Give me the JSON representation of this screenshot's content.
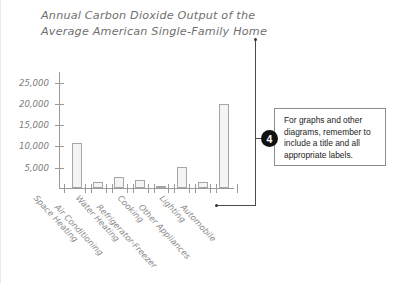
{
  "chart_data": {
    "type": "bar",
    "title": "Annual Carbon Dioxide Output of the\nAverage American Single-Family Home",
    "xlabel": "",
    "ylabel": "",
    "ylim": [
      0,
      27500
    ],
    "grid": false,
    "legend": "none",
    "ytick_labels": [
      "5,000",
      "10,000",
      "15,000",
      "20,000",
      "25,000"
    ],
    "ytick_values": [
      5000,
      10000,
      15000,
      20000,
      25000
    ],
    "categories": [
      "Space Heating",
      "Air Conditioning",
      "Water Heating",
      "Refrigerator-Freezer",
      "Cooking",
      "Other Appliances",
      "Lighting",
      "Automobile"
    ],
    "values": [
      10500,
      1500,
      2600,
      1800,
      400,
      4900,
      1400,
      19800
    ]
  },
  "callout": {
    "number": "4",
    "text": "For graphs and other diagrams, remember to include a title and all appropriate labels."
  }
}
